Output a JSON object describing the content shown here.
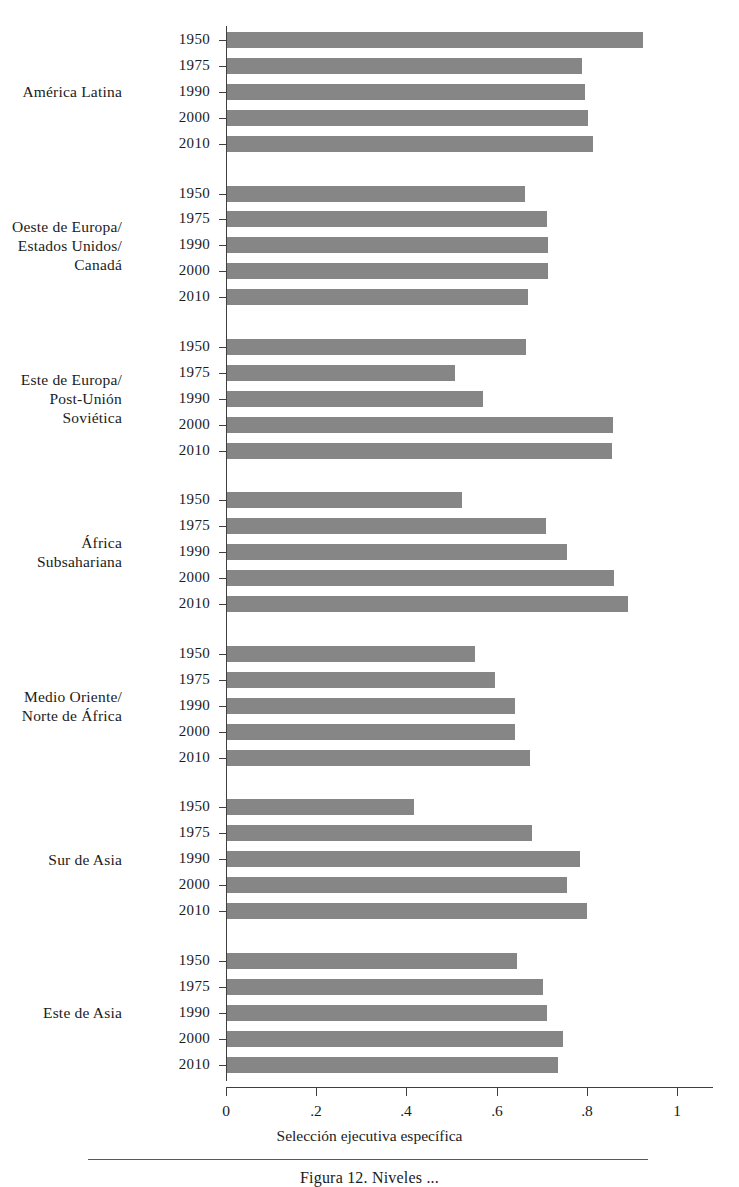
{
  "figure": {
    "caption": "Figura 12.  Niveles ...",
    "axis_title": "Selección ejecutiva específica"
  },
  "chart_data": {
    "type": "bar",
    "orientation": "horizontal",
    "title": "",
    "xlabel": "Selección ejecutiva específica",
    "ylabel": "",
    "xlim": [
      0,
      1.08
    ],
    "xticks": [
      0,
      0.2,
      0.4,
      0.6,
      0.8,
      1
    ],
    "xticklabels": [
      "0",
      ".2",
      ".4",
      ".6",
      ".8",
      "1"
    ],
    "grid": false,
    "legend": "none",
    "bar_color": "#868686",
    "axis_color": "#3f3f3f",
    "year_categories": [
      "1950",
      "1975",
      "1990",
      "2000",
      "2010"
    ],
    "groups": [
      {
        "label": "América Latina",
        "label_lines": [
          "América Latina"
        ],
        "years": [
          "1950",
          "1975",
          "1990",
          "2000",
          "2010"
        ],
        "values": [
          0.925,
          0.789,
          0.796,
          0.803,
          0.814
        ]
      },
      {
        "label": "Oeste de Europa/ Estados Unidos/ Canadá",
        "label_lines": [
          "Oeste de Europa/",
          "Estados Unidos/",
          "Canadá"
        ],
        "years": [
          "1950",
          "1975",
          "1990",
          "2000",
          "2010"
        ],
        "values": [
          0.663,
          0.712,
          0.714,
          0.714,
          0.67
        ]
      },
      {
        "label": "Este de Europa/ Post-Unión Soviética",
        "label_lines": [
          "Este de Europa/",
          "Post-Unión",
          "Soviética"
        ],
        "years": [
          "1950",
          "1975",
          "1990",
          "2000",
          "2010"
        ],
        "values": [
          0.665,
          0.508,
          0.57,
          0.858,
          0.856
        ]
      },
      {
        "label": "África Subsahariana",
        "label_lines": [
          "África",
          "Subsahariana"
        ],
        "years": [
          "1950",
          "1975",
          "1990",
          "2000",
          "2010"
        ],
        "values": [
          0.523,
          0.71,
          0.756,
          0.86,
          0.892
        ]
      },
      {
        "label": "Medio Oriente/ Norte de África",
        "label_lines": [
          "Medio Oriente/",
          "Norte de África"
        ],
        "years": [
          "1950",
          "1975",
          "1990",
          "2000",
          "2010"
        ],
        "values": [
          0.552,
          0.596,
          0.641,
          0.641,
          0.674
        ]
      },
      {
        "label": "Sur de Asia",
        "label_lines": [
          "Sur de Asia"
        ],
        "years": [
          "1950",
          "1975",
          "1990",
          "2000",
          "2010"
        ],
        "values": [
          0.417,
          0.678,
          0.785,
          0.756,
          0.8
        ]
      },
      {
        "label": "Este de Asia",
        "label_lines": [
          "Este de Asia"
        ],
        "years": [
          "1950",
          "1975",
          "1990",
          "2000",
          "2010"
        ],
        "values": [
          0.645,
          0.703,
          0.712,
          0.747,
          0.736
        ]
      }
    ]
  }
}
